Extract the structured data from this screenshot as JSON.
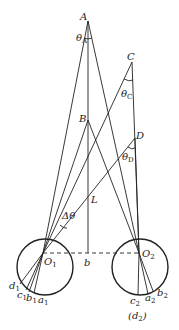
{
  "figure": {
    "caption": "(d",
    "caption_sub": "2",
    "caption_close": ")",
    "points": {
      "A": {
        "label": "A"
      },
      "B": {
        "label": "B"
      },
      "C": {
        "label": "C"
      },
      "D": {
        "label": "D"
      },
      "L": {
        "label": "L"
      },
      "b": {
        "label": "b"
      },
      "O1": {
        "label": "O",
        "sub": "1"
      },
      "O2": {
        "label": "O",
        "sub": "2"
      }
    },
    "angles": {
      "thetaA": {
        "label": "θ",
        "sub": "A"
      },
      "thetaC": {
        "label": "θ",
        "sub": "C"
      },
      "thetaD": {
        "label": "θ",
        "sub": "D"
      },
      "delta": {
        "label": "Δθ"
      }
    },
    "left_eye": {
      "d": {
        "label": "d",
        "sub": "1"
      },
      "c": {
        "label": "c",
        "sub": "1"
      },
      "b": {
        "label": "b",
        "sub": "1"
      },
      "a": {
        "label": "a",
        "sub": "1"
      }
    },
    "right_eye": {
      "c": {
        "label": "c",
        "sub": "2"
      },
      "a": {
        "label": "a",
        "sub": "2"
      },
      "b": {
        "label": "b",
        "sub": "2"
      }
    },
    "colors": {
      "line": "#222222",
      "background": "#ffffff"
    }
  }
}
